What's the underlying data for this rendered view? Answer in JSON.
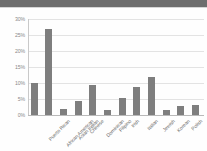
{
  "chart_data": {
    "type": "bar",
    "title": "",
    "xlabel": "",
    "ylabel": "",
    "ylim": [
      0,
      30
    ],
    "ytick_labels": [
      "0%",
      "5%",
      "10%",
      "15%",
      "20%",
      "25%",
      "30%"
    ],
    "ytick_values": [
      0,
      5,
      10,
      15,
      20,
      25,
      30
    ],
    "grid": true,
    "legend": false,
    "bar_color": "#7e7e7e",
    "value_suffix": "%",
    "categories": [
      "Puerto Rican",
      "African American",
      "Asian Indian",
      "Chinese",
      "Dominican",
      "Filipino",
      "Irish",
      "Italian",
      "Jewish",
      "Korean",
      "Polish",
      "Russian"
    ],
    "values": [
      10,
      26.8,
      2,
      4.5,
      9.5,
      1.7,
      5.3,
      8.8,
      12,
      1.5,
      2.7,
      3
    ]
  },
  "colors": {
    "background": "#fdfdfd",
    "topbar": "#6e6e6e",
    "gridline": "#e3e3e3",
    "axis": "#b9b9b9",
    "tick_text": "#8a8a8a",
    "label_text": "#6b6b6b"
  }
}
